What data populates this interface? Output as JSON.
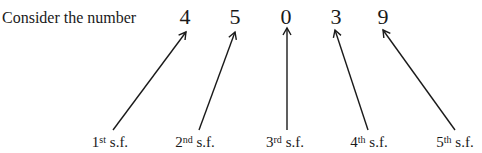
{
  "intro_text": "Consider the number",
  "digits": [
    {
      "value": "4",
      "x": 185
    },
    {
      "value": "5",
      "x": 235
    },
    {
      "value": "0",
      "x": 286
    },
    {
      "value": "3",
      "x": 336
    },
    {
      "value": "9",
      "x": 383
    }
  ],
  "labels": [
    {
      "num": "1",
      "suffix": "st",
      "text": " s.f.",
      "x": 110
    },
    {
      "num": "2",
      "suffix": "nd",
      "text": " s.f.",
      "x": 195
    },
    {
      "num": "3",
      "suffix": "rd",
      "text": " s.f.",
      "x": 285
    },
    {
      "num": "4",
      "suffix": "th",
      "text": " s.f.",
      "x": 369
    },
    {
      "num": "5",
      "suffix": "th",
      "text": " s.f.",
      "x": 455
    }
  ],
  "arrows": [
    {
      "x1": 113,
      "y1": 130,
      "x2": 186,
      "y2": 32
    },
    {
      "x1": 199,
      "y1": 130,
      "x2": 235,
      "y2": 32
    },
    {
      "x1": 287,
      "y1": 130,
      "x2": 287,
      "y2": 28
    },
    {
      "x1": 368,
      "y1": 130,
      "x2": 335,
      "y2": 30
    },
    {
      "x1": 455,
      "y1": 130,
      "x2": 383,
      "y2": 30
    }
  ],
  "colors": {
    "ink": "#1a1a1a",
    "background": "#ffffff"
  }
}
